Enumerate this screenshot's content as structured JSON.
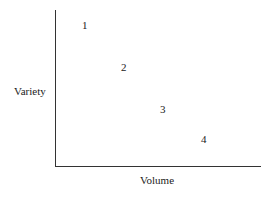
{
  "chart_data": {
    "type": "scatter",
    "title": "",
    "xlabel": "Volume",
    "ylabel": "Variety",
    "grid": false,
    "legend": null,
    "points": [
      {
        "label": "1",
        "x": 1,
        "y": 4,
        "px": 82,
        "py": 20
      },
      {
        "label": "2",
        "x": 2,
        "y": 3,
        "px": 121,
        "py": 62
      },
      {
        "label": "3",
        "x": 3,
        "y": 2,
        "px": 160,
        "py": 104
      },
      {
        "label": "4",
        "x": 4,
        "y": 1,
        "px": 201,
        "py": 134
      }
    ]
  }
}
